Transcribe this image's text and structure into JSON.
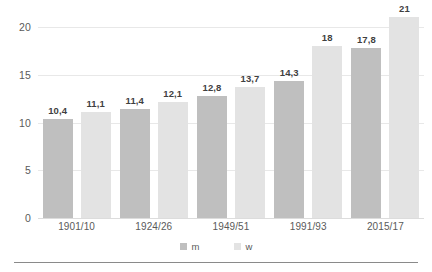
{
  "chart_data": {
    "type": "bar",
    "title": "",
    "subtitle": "",
    "xlabel": "",
    "ylabel": "",
    "categories": [
      "1901/10",
      "1924/26",
      "1949/51",
      "1991/93",
      "2015/17"
    ],
    "series": [
      {
        "name": "m",
        "color": "#bfbfbf",
        "values": [
          10.4,
          11.4,
          12.8,
          14.3,
          17.8
        ],
        "labels": [
          "10,4",
          "11,4",
          "12,8",
          "14,3",
          "17,8"
        ]
      },
      {
        "name": "w",
        "color": "#e3e3e3",
        "values": [
          11.1,
          12.1,
          13.7,
          18.0,
          21.0
        ],
        "labels": [
          "11,1",
          "12,1",
          "13,7",
          "18",
          "21"
        ]
      }
    ],
    "ylim": [
      0,
      20
    ],
    "yticks": [
      0,
      5,
      10,
      15,
      20
    ],
    "ytick_labels": [
      "0",
      "5",
      "10",
      "15",
      "20"
    ],
    "grid": true,
    "grid_axis": "y",
    "legend_position": "bottom"
  },
  "axes": {
    "y_ticks": [
      {
        "value": 20,
        "label": "20"
      },
      {
        "value": 15,
        "label": "15"
      },
      {
        "value": 10,
        "label": "10"
      },
      {
        "value": 5,
        "label": "5"
      },
      {
        "value": 0,
        "label": "0"
      }
    ],
    "x_ticks": [
      {
        "label": "1901/10"
      },
      {
        "label": "1924/26"
      },
      {
        "label": "1949/51"
      },
      {
        "label": "1991/93"
      },
      {
        "label": "2015/17"
      }
    ]
  },
  "legend": {
    "items": [
      {
        "label": "m",
        "color": "#bfbfbf"
      },
      {
        "label": "w",
        "color": "#e3e3e3"
      }
    ]
  },
  "colors": {
    "series_m": "#bfbfbf",
    "series_w": "#e3e3e3",
    "gridline": "#e8e8e8",
    "axis_text": "#5a5a5a",
    "data_label_text": "#3f3f3f",
    "rule": "#8a8a8a",
    "background": "#ffffff"
  }
}
